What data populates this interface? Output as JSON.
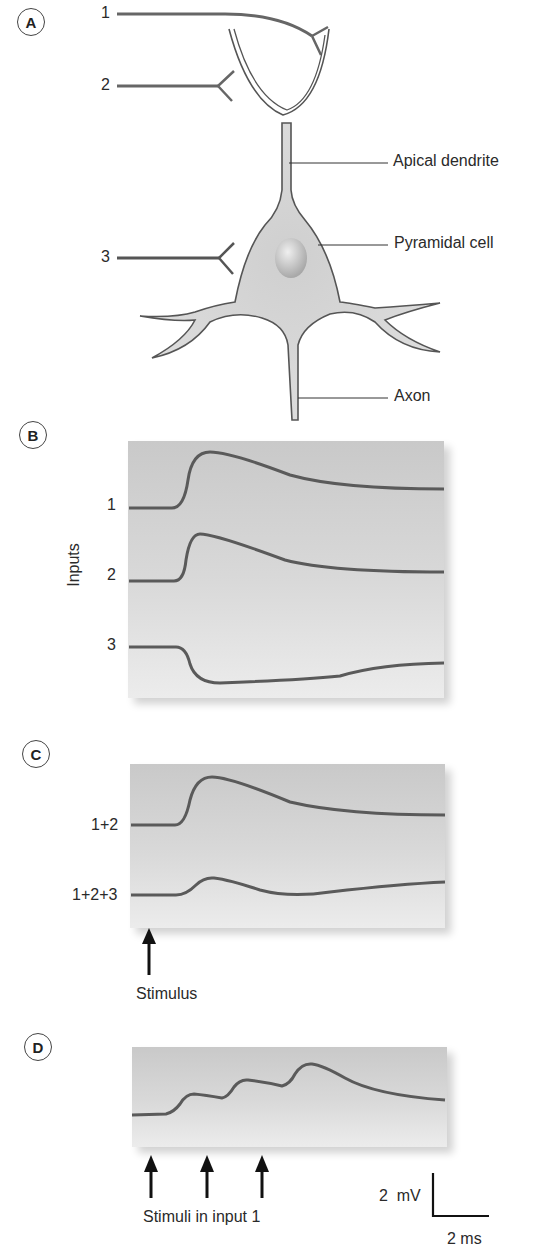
{
  "colors": {
    "trace": "#5a5a5a",
    "outline": "#555555",
    "cell_fill": "#d8d8d8",
    "panel_bg_top": "#c9c9c9",
    "panel_bg_bottom": "#ececec",
    "arrow": "#111111"
  },
  "panelA": {
    "letter": "A",
    "inputs": [
      "1",
      "2",
      "3"
    ],
    "labels": {
      "apical_dendrite": "Apical dendrite",
      "pyramidal_cell": "Pyramidal cell",
      "axon": "Axon"
    }
  },
  "panelB": {
    "letter": "B",
    "ylabel": "Inputs",
    "traces": [
      "1",
      "2",
      "3"
    ]
  },
  "panelC": {
    "letter": "C",
    "traces": [
      "1+2",
      "1+2+3"
    ],
    "arrow_label": "Stimulus"
  },
  "panelD": {
    "letter": "D",
    "arrow_label": "Stimuli in input 1",
    "scale_v": "2  mV",
    "scale_t": "2 ms"
  }
}
